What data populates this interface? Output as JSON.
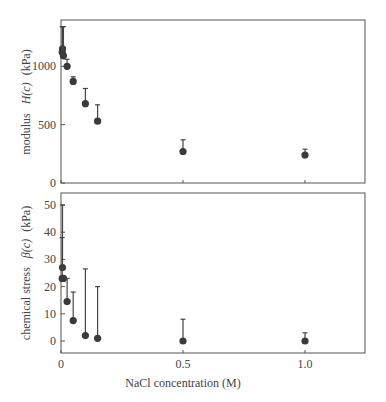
{
  "chart_data": [
    {
      "type": "scatter",
      "panel": "top",
      "title": "",
      "xlabel": "",
      "ylabel_prefix": "modulus",
      "ylabel_symbol": "H(c)",
      "ylabel_unit": "(kPa)",
      "ylabel": "modulus H(c) (kPa)",
      "ylim": [
        0,
        1340
      ],
      "xlim": [
        0,
        1.25
      ],
      "yticks": [
        0,
        500,
        1000
      ],
      "ytick_labels": [
        "0",
        "500",
        "1000"
      ],
      "xticks": [
        0,
        0.5,
        1.0
      ],
      "grid": false,
      "series": [
        {
          "name": "H(c)",
          "x": [
            0,
            0.005,
            0.01,
            0.025,
            0.05,
            0.1,
            0.15,
            0.5,
            1.0
          ],
          "y": [
            1150,
            1120,
            1090,
            1000,
            870,
            680,
            530,
            270,
            240
          ],
          "error_upper": [
            1340,
            1340,
            1340,
            1060,
            910,
            810,
            670,
            370,
            290
          ]
        }
      ]
    },
    {
      "type": "scatter",
      "panel": "bottom",
      "title": "",
      "xlabel": "NaCl concentration (M)",
      "ylabel_prefix": "chemical stress",
      "ylabel_symbol": "β(c)",
      "ylabel_unit": "(kPa)",
      "ylabel": "chemical stress β(c) (kPa)",
      "ylim": [
        -4,
        55
      ],
      "xlim": [
        0,
        1.25
      ],
      "yticks": [
        0,
        10,
        20,
        30,
        40,
        50
      ],
      "ytick_labels": [
        "0",
        "10",
        "20",
        "30",
        "40",
        "50"
      ],
      "xticks": [
        0,
        0.5,
        1.0
      ],
      "xtick_labels": [
        "0",
        "0.5",
        "1.0"
      ],
      "grid": false,
      "series": [
        {
          "name": "β(c)",
          "x": [
            0,
            0.005,
            0.01,
            0.025,
            0.05,
            0.1,
            0.15,
            0.5,
            1.0
          ],
          "y": [
            27,
            23,
            23,
            14.5,
            7.5,
            2,
            1,
            0,
            0
          ],
          "error_upper": [
            50,
            38,
            23,
            23,
            18,
            26.5,
            20,
            8,
            3
          ]
        }
      ]
    }
  ]
}
